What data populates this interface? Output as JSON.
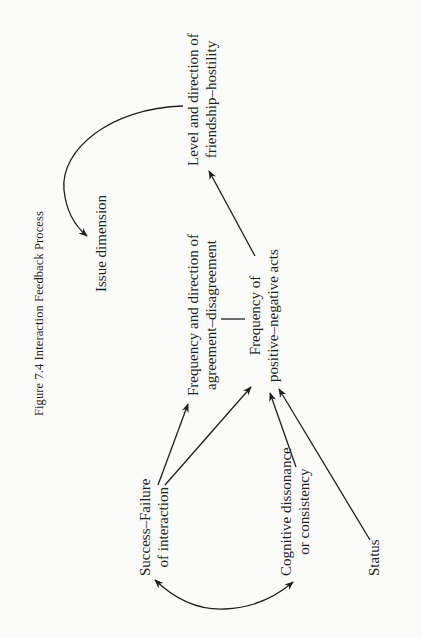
{
  "caption": "Figure 7.4  Interaction Feedback Process",
  "nodes": {
    "friendship": {
      "line1": "Level and direction of",
      "line2": "friendship–hostility"
    },
    "issue": {
      "line1": "Issue dimension"
    },
    "agreement": {
      "line1": "Frequency and direction of",
      "line2": "agreement–disagreement"
    },
    "positive": {
      "line1": "Frequency of",
      "line2": "positive–negative acts"
    },
    "success": {
      "line1": "Success–Failure",
      "line2": "of interaction"
    },
    "cognitive": {
      "line1": "Cognitive dissonance",
      "line2": "or consistency"
    },
    "status": {
      "line1": "Status"
    }
  },
  "edges": [
    {
      "from": "friendship",
      "to": "issue",
      "type": "curved"
    },
    {
      "from": "positive",
      "to": "friendship",
      "type": "straight"
    },
    {
      "from": "agreement",
      "to": "positive",
      "type": "link-no-arrow"
    },
    {
      "from": "success",
      "to": "agreement",
      "type": "straight"
    },
    {
      "from": "success",
      "to": "positive",
      "type": "straight"
    },
    {
      "from": "cognitive",
      "to": "positive",
      "type": "straight"
    },
    {
      "from": "status",
      "to": "positive",
      "type": "straight"
    },
    {
      "from": "success",
      "to": "cognitive",
      "type": "curved-bidirectional"
    }
  ],
  "colors": {
    "ink": "#1f1f1f",
    "paper": "#fbfbfa"
  }
}
